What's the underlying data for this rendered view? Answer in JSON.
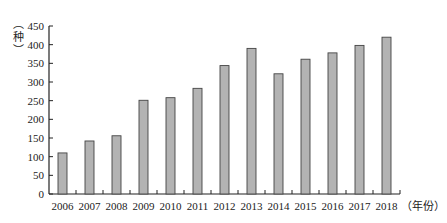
{
  "chart_data": {
    "type": "bar",
    "title": "",
    "xlabel": "（年份）",
    "ylabel": "（种）",
    "categories": [
      "2006",
      "2007",
      "2008",
      "2009",
      "2010",
      "2011",
      "2012",
      "2013",
      "2014",
      "2015",
      "2016",
      "2017",
      "2018"
    ],
    "values": [
      110,
      142,
      156,
      251,
      258,
      283,
      344,
      390,
      322,
      361,
      378,
      398,
      420
    ],
    "ylim": [
      0,
      450
    ],
    "yticks": [
      0,
      50,
      100,
      150,
      200,
      250,
      300,
      350,
      400,
      450
    ],
    "grid": false,
    "legend": null,
    "bar_color": "#b3b3b3",
    "bar_edge_color": "#444444"
  }
}
